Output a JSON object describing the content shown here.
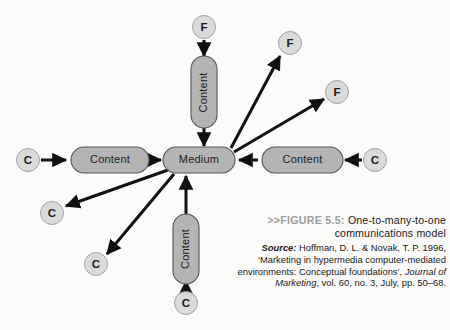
{
  "figure": {
    "tag": ">>FIGURE 5.5:",
    "title_line1": "One-to-many-to-one",
    "title_line2": "communications model",
    "source_label": "Source:",
    "source_line1": " Hoffman, D. L. & Novak, T. P. 1996,",
    "source_line2": "‘Marketing in hypermedia computer-mediated",
    "source_line3_a": "environments: Conceptual foundations’, ",
    "source_line3_b": "Journal of",
    "source_line4_a": "Marketing",
    "source_line4_b": ", vol. 60, no. 3, July, pp. 50–68."
  },
  "diagram": {
    "type": "network",
    "center_node": {
      "label": "Medium",
      "shape": "pill",
      "x": 198,
      "y": 160
    },
    "content_nodes": [
      {
        "id": "content-left",
        "label": "Content",
        "orientation": "horizontal",
        "x": 107,
        "y": 160
      },
      {
        "id": "content-right",
        "label": "Content",
        "orientation": "horizontal",
        "x": 300,
        "y": 160
      },
      {
        "id": "content-top",
        "label": "Content",
        "orientation": "vertical",
        "x": 204,
        "y": 92
      },
      {
        "id": "content-bottom",
        "label": "Content",
        "orientation": "vertical",
        "x": 186,
        "y": 248
      }
    ],
    "endpoint_nodes": [
      {
        "id": "c-left",
        "label": "C",
        "x": 28,
        "y": 160
      },
      {
        "id": "c-right",
        "label": "C",
        "x": 375,
        "y": 160
      },
      {
        "id": "c-bottom",
        "label": "C",
        "x": 186,
        "y": 303
      },
      {
        "id": "c-lower-left1",
        "label": "C",
        "x": 52,
        "y": 213
      },
      {
        "id": "c-lower-left2",
        "label": "C",
        "x": 96,
        "y": 264
      },
      {
        "id": "f-top",
        "label": "F",
        "x": 204,
        "y": 27
      },
      {
        "id": "f-upper-right1",
        "label": "F",
        "x": 290,
        "y": 43
      },
      {
        "id": "f-upper-right2",
        "label": "F",
        "x": 337,
        "y": 92
      }
    ],
    "edges": [
      {
        "from": "c-left",
        "to": "content-left",
        "direction": "in"
      },
      {
        "from": "content-left",
        "to": "center",
        "direction": "in"
      },
      {
        "from": "c-right",
        "to": "content-right",
        "direction": "in"
      },
      {
        "from": "content-right",
        "to": "center",
        "direction": "in"
      },
      {
        "from": "f-top",
        "to": "content-top",
        "direction": "in"
      },
      {
        "from": "content-top",
        "to": "center",
        "direction": "in"
      },
      {
        "from": "c-bottom",
        "to": "content-bottom",
        "direction": "in"
      },
      {
        "from": "content-bottom",
        "to": "center",
        "direction": "in"
      },
      {
        "from": "center",
        "to": "f-upper-right1",
        "direction": "out"
      },
      {
        "from": "center",
        "to": "f-upper-right2",
        "direction": "out"
      },
      {
        "from": "center",
        "to": "c-lower-left1",
        "direction": "out"
      },
      {
        "from": "center",
        "to": "c-lower-left2",
        "direction": "out"
      }
    ],
    "colors": {
      "pill_fill": "#b4b4b4",
      "pill_stroke": "#555555",
      "circle_fill": "#dadada",
      "circle_stroke": "#9a9a9a",
      "arrow": "#111111",
      "background": "#fbfbfa"
    }
  }
}
